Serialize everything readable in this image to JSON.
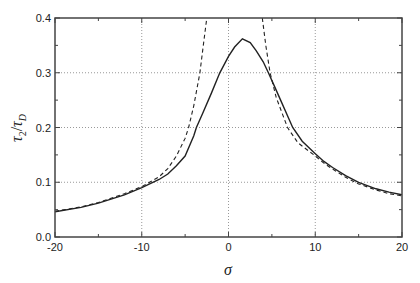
{
  "chart_data": {
    "type": "line",
    "title": "",
    "xlabel": "σ",
    "ylabel": "τ2/τD",
    "ylabel_parts": {
      "main": "τ",
      "sub1": "2",
      "slash": "/",
      "main2": "τ",
      "sub2": "D"
    },
    "xlim": [
      -20,
      20
    ],
    "ylim": [
      0.0,
      0.4
    ],
    "x_ticks": [
      -20,
      -10,
      0,
      10,
      20
    ],
    "x_tick_labels": [
      "-20",
      "-10",
      "0",
      "10",
      "20"
    ],
    "x_minor_ticks": [
      -15,
      -5,
      5,
      15
    ],
    "y_ticks": [
      0.0,
      0.1,
      0.2,
      0.3,
      0.4
    ],
    "y_tick_labels": [
      "0.0",
      "0.1",
      "0.2",
      "0.3",
      "0.4"
    ],
    "y_minor_ticks": [
      0.05,
      0.15,
      0.25,
      0.35
    ],
    "grid": {
      "x": [
        -10,
        0,
        10
      ],
      "y": [
        0.1,
        0.2,
        0.3
      ],
      "style": "dotted"
    },
    "legend": null,
    "values_note": "Approximate values read off pixel positions; the dashed curve goes past 0.4 between about -2.5 and 3.9",
    "series": [
      {
        "name": "solid",
        "style": "solid",
        "x": [
          -20,
          -17,
          -15,
          -12,
          -10,
          -8,
          -7,
          -6,
          -5,
          -4,
          -3.7,
          -3,
          -2,
          -1,
          0,
          0.7,
          1.6,
          2.5,
          3.2,
          4,
          4.6,
          5.3,
          6,
          7.4,
          8.5,
          10,
          11,
          12,
          13.5,
          15,
          17,
          18.5,
          20
        ],
        "values": [
          0.046,
          0.054,
          0.062,
          0.077,
          0.09,
          0.105,
          0.115,
          0.13,
          0.148,
          0.185,
          0.2,
          0.225,
          0.262,
          0.3,
          0.33,
          0.347,
          0.362,
          0.355,
          0.34,
          0.32,
          0.3,
          0.275,
          0.25,
          0.2,
          0.175,
          0.152,
          0.138,
          0.127,
          0.112,
          0.1,
          0.088,
          0.082,
          0.077
        ]
      },
      {
        "name": "dashed",
        "style": "dashed",
        "x": [
          -20,
          -17,
          -15,
          -12,
          -10,
          -8,
          -7,
          -6,
          -5,
          -4.6,
          -4,
          -3.3,
          -2.9,
          -2.5,
          3.9,
          4.3,
          4.8,
          5.5,
          6.8,
          8,
          10,
          11,
          12,
          13.5,
          15,
          17,
          18.5,
          20
        ],
        "values": [
          0.047,
          0.055,
          0.063,
          0.079,
          0.092,
          0.11,
          0.125,
          0.148,
          0.18,
          0.2,
          0.24,
          0.3,
          0.35,
          0.4,
          0.4,
          0.35,
          0.3,
          0.255,
          0.2,
          0.172,
          0.148,
          0.135,
          0.124,
          0.109,
          0.097,
          0.086,
          0.079,
          0.075
        ]
      }
    ]
  }
}
